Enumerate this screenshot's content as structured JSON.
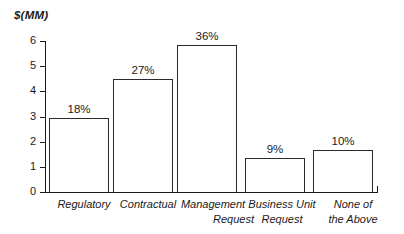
{
  "chart_data": {
    "type": "bar",
    "title": "",
    "subtitle": "",
    "xlabel": "",
    "ylabel": "$(MM)",
    "ylim": [
      0,
      6
    ],
    "y_ticks": [
      "0",
      "1",
      "2",
      "3",
      "4",
      "5",
      "6"
    ],
    "grid": false,
    "legend": "none",
    "categories": [
      "Regulatory",
      "Management Request",
      "Management Request",
      "Business Unit Request",
      "None of the Above"
    ],
    "category_lines": [
      [
        "Regulatory"
      ],
      [
        "Contractual"
      ],
      [
        "Management",
        "Request"
      ],
      [
        "Business Unit",
        "Request"
      ],
      [
        "None of",
        "the Above"
      ]
    ],
    "values": [
      2.95,
      4.5,
      5.85,
      1.35,
      1.65
    ],
    "data_labels": [
      "18%",
      "27%",
      "36%",
      "9%",
      "10%"
    ],
    "bars": [
      {
        "label_line1": "Regulatory",
        "label_line2": "",
        "value": 2.95,
        "data_label": "18%",
        "left_px": 4,
        "width_px": 60
      },
      {
        "label_line1": "Contractual",
        "label_line2": "",
        "value": 4.5,
        "data_label": "27%",
        "left_px": 68,
        "width_px": 60
      },
      {
        "label_line1": "Management",
        "label_line2": "Request",
        "value": 5.85,
        "data_label": "36%",
        "left_px": 132,
        "width_px": 60
      },
      {
        "label_line1": "Business Unit",
        "label_line2": "Request",
        "value": 1.35,
        "data_label": "9%",
        "left_px": 200,
        "width_px": 60
      },
      {
        "label_line1": "None of",
        "label_line2": "the Above",
        "value": 1.65,
        "data_label": "10%",
        "left_px": 268,
        "width_px": 60
      }
    ],
    "colors": {
      "bar_fill": "#ffffff",
      "bar_stroke": "#2a2a2a",
      "axis": "#1a1a1a",
      "text": "#1a1a1a",
      "background": "#ffffff"
    }
  },
  "yticks": {
    "t0": "0",
    "t1": "1",
    "t2": "2",
    "t3": "3",
    "t4": "4",
    "t5": "5",
    "t6": "6"
  },
  "bar_labels": {
    "b0": "18%",
    "b1": "27%",
    "b2": "36%",
    "b3": "9%",
    "b4": "10%"
  },
  "cat_labels": {
    "c0_l1": "Regulatory",
    "c1_l1": "Contractual",
    "c2_l1": "Management",
    "c2_l2": "Request",
    "c3_l1": "Business Unit",
    "c3_l2": "Request",
    "c4_l1": "None of",
    "c4_l2": "the Above"
  }
}
